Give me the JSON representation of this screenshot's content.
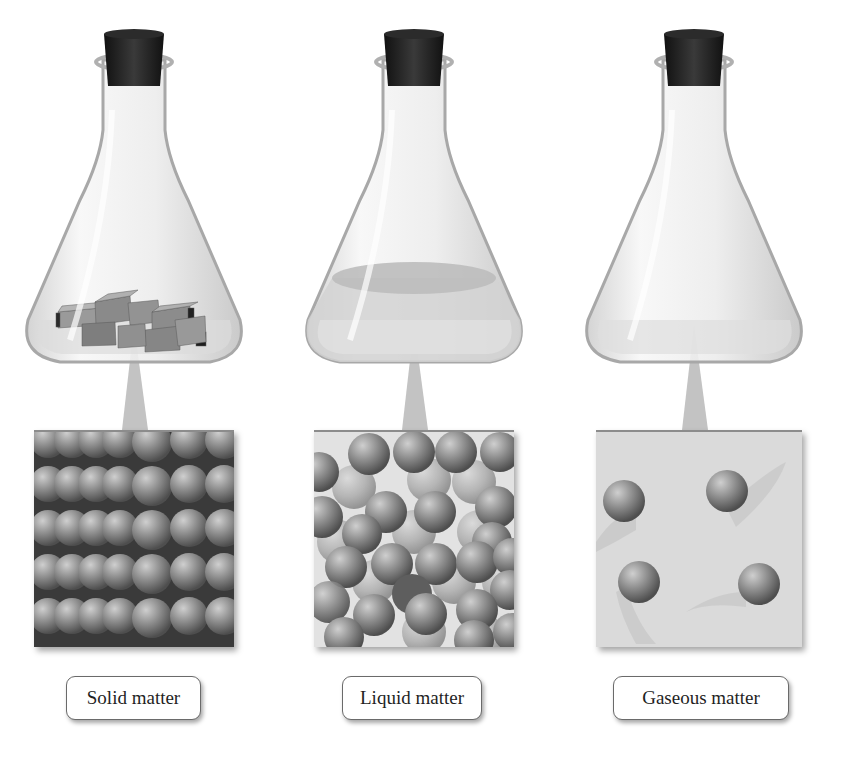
{
  "diagram": {
    "panels": [
      {
        "id": "solid",
        "label": "Solid matter",
        "flask_contents": "gray blocks",
        "particle_arrangement": "closely packed in regular rows",
        "particle_count_visible": 35
      },
      {
        "id": "liquid",
        "label": "Liquid matter",
        "flask_contents": "liquid layer",
        "particle_arrangement": "closely packed, disordered",
        "particle_count_visible": 40
      },
      {
        "id": "gas",
        "label": "Gaseous matter",
        "flask_contents": "empty (gas)",
        "particle_arrangement": "widely spaced, moving",
        "particle_count_visible": 4
      }
    ],
    "colors": {
      "cork": "#1e1e1e",
      "glass_edge": "#a8a8a8",
      "particle": "#7a7a7a",
      "zoom_background": "#d7d7d7",
      "pointer": "#bdbdbd"
    }
  }
}
